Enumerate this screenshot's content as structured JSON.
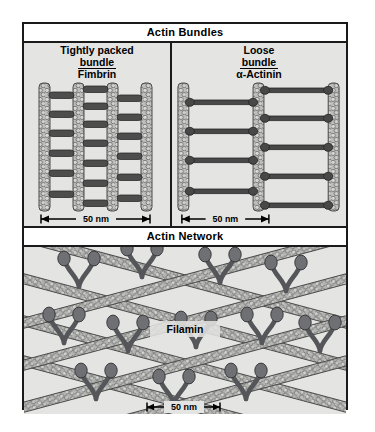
{
  "figure": {
    "sections": [
      {
        "header": "Actin Bundles",
        "panels": [
          {
            "caption_line1": "Tightly packed",
            "caption_line2": "bundle",
            "caption_line3": "Fimbrin",
            "scale_label": "50 nm",
            "filament_count": 4,
            "crosslink_style": "short-bar"
          },
          {
            "caption_line1": "Loose",
            "caption_line2": "bundle",
            "caption_line3": "α-Actinin",
            "scale_label": "50 nm",
            "filament_count": 3,
            "crosslink_style": "long-dumbbell"
          }
        ]
      },
      {
        "header": "Actin Network",
        "node_label": "Filamin",
        "scale_label": "50 nm",
        "crosslink_style": "v-fork"
      }
    ],
    "colors": {
      "frame": "#1a1a1a",
      "panel_background": "#e4e4e2",
      "header_background": "#ffffff",
      "filament_fill": "#b9b9b7",
      "filament_stroke": "#4a4a4a",
      "crosslink": "#4d4d4d",
      "text": "#000000"
    }
  }
}
